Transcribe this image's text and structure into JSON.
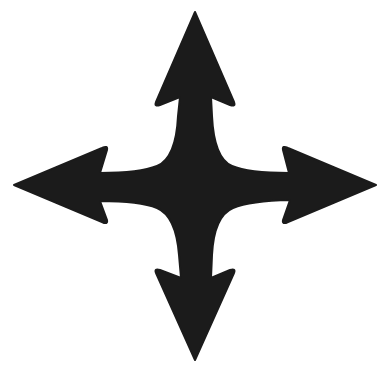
{
  "image": {
    "subject": "four-direction-arrows",
    "description": "Black four-way arrow symbol pointing up, down, left and right",
    "background_color": "#ffffff",
    "fill_color": "#1b1b1b",
    "arrows": [
      "up",
      "right",
      "down",
      "left"
    ]
  }
}
